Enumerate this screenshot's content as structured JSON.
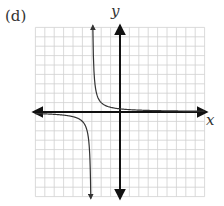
{
  "figure": {
    "panel_label": "(d)",
    "x_axis_label": "x",
    "y_axis_label": "y"
  },
  "colors": {
    "grid": "#d0d0d0",
    "axis": "#111111",
    "curve": "#333333"
  },
  "chart_data": {
    "type": "line",
    "title": "(d)",
    "xlabel": "x",
    "ylabel": "y",
    "xlim": [
      -9,
      9
    ],
    "ylim": [
      -9,
      9
    ],
    "grid": true,
    "axis_ticks_labeled": false,
    "vertical_asymptote": -3,
    "horizontal_asymptote": 0,
    "function_approx": "y = 1/(x+3)",
    "series": [
      {
        "name": "curve",
        "branches": [
          {
            "x": [
              -9,
              -7,
              -5,
              -4,
              -3.5,
              -3.25,
              -3.12
            ],
            "y": [
              -0.17,
              -0.25,
              -0.5,
              -1,
              -2,
              -4,
              -8.3
            ]
          },
          {
            "x": [
              -2.88,
              -2.75,
              -2.5,
              -2,
              -1,
              0,
              2,
              5,
              9
            ],
            "y": [
              8.3,
              4,
              2,
              1,
              0.5,
              0.33,
              0.2,
              0.125,
              0.08
            ]
          }
        ]
      }
    ]
  }
}
